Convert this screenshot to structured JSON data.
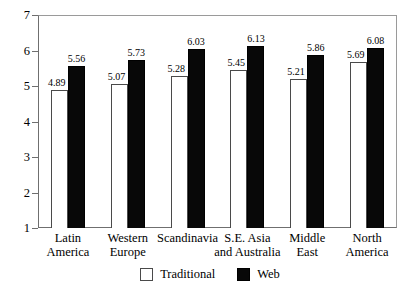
{
  "chart_data": {
    "type": "bar",
    "title": "",
    "subtitle": "",
    "xlabel": "",
    "ylabel": "",
    "ylim": [
      1,
      7
    ],
    "yticks": [
      1,
      2,
      3,
      4,
      5,
      6,
      7
    ],
    "ytick_labels": [
      "1",
      "2",
      "3",
      "4",
      "5",
      "6",
      "7"
    ],
    "grid": false,
    "legend_position": "bottom-center",
    "categories": [
      "Latin America",
      "Western Europe",
      "Scandinavia",
      "S.E. Asia and Australia",
      "Middle East",
      "North America"
    ],
    "category_lines": [
      [
        "Latin",
        "America"
      ],
      [
        "Western",
        "Europe"
      ],
      [
        "Scandinavia",
        ""
      ],
      [
        "S.E. Asia",
        "and Australia"
      ],
      [
        "Middle",
        "East"
      ],
      [
        "North",
        "America"
      ]
    ],
    "series": [
      {
        "name": "Traditional",
        "color": "#ffffff",
        "edge_color": "#4a4a4a",
        "values": [
          4.89,
          5.07,
          5.28,
          5.45,
          5.21,
          5.69
        ],
        "labels": [
          "4.89",
          "5.07",
          "5.28",
          "5.45",
          "5.21",
          "5.69"
        ]
      },
      {
        "name": "Web",
        "color": "#080808",
        "edge_color": "#000000",
        "values": [
          5.56,
          5.73,
          6.03,
          6.13,
          5.86,
          6.08
        ],
        "labels": [
          "5.56",
          "5.73",
          "6.03",
          "6.13",
          "5.86",
          "6.08"
        ]
      }
    ]
  },
  "legend": {
    "items": [
      {
        "label": "Traditional",
        "swatch": "open-square-swatch"
      },
      {
        "label": "Web",
        "swatch": "filled-square-swatch"
      }
    ]
  },
  "colors": {
    "traditional_fill": "#ffffff",
    "web_fill": "#080808",
    "axis": "#6f6f6f",
    "frame": "#9a9a9a",
    "text": "#000000",
    "background": "#ffffff"
  }
}
